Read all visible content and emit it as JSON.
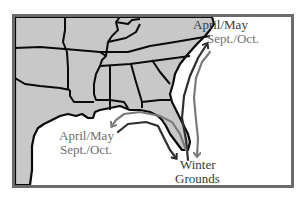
{
  "map": {
    "region": "Southeastern United States",
    "colors": {
      "land": "#c8c8c8",
      "water": "#ffffff",
      "borders": "#0a0a0a",
      "frame": "#6b6b6b",
      "route_dark": "#2e2e2e",
      "route_light": "#7a7a7a"
    },
    "labels": {
      "northeast_spring": "April/May",
      "northeast_fall": "Sept./Oct.",
      "gulf_spring": "April/May",
      "gulf_fall": "Sept./Oct.",
      "winter_line1": "Winter",
      "winter_line2": "Grounds"
    },
    "routes": [
      {
        "name": "atlantic-spring-route",
        "shade": "dark",
        "direction": "northbound"
      },
      {
        "name": "atlantic-fall-route",
        "shade": "light",
        "direction": "southbound"
      },
      {
        "name": "gulf-spring-route",
        "shade": "light",
        "direction": "westbound"
      },
      {
        "name": "gulf-fall-route",
        "shade": "dark",
        "direction": "southbound"
      }
    ]
  }
}
